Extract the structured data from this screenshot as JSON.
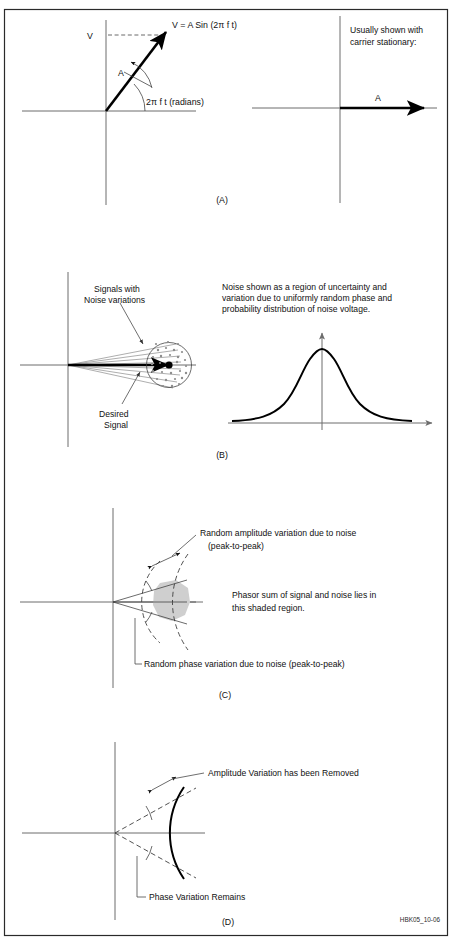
{
  "figure": {
    "code": "HBK05_10-06",
    "panels": [
      {
        "id": "A",
        "label": "(A)"
      },
      {
        "id": "B",
        "label": "(B)"
      },
      {
        "id": "C",
        "label": "(C)"
      },
      {
        "id": "D",
        "label": "(D)"
      }
    ]
  },
  "panel_a": {
    "label": "(A)",
    "equation": "V = A Sin (2π f t)",
    "v_axis_label": "V",
    "amplitude_label": "A",
    "angle_label": "2π f t (radians)",
    "right_note_line1": "Usually shown with",
    "right_note_line2": "carrier stationary:",
    "right_amplitude_label": "A"
  },
  "panel_b": {
    "label": "(B)",
    "signals_label_line1": "Signals with",
    "signals_label_line2": "Noise variations",
    "desired_label_line1": "Desired",
    "desired_label_line2": "Signal",
    "description_line1": "Noise shown as a region of uncertainty and",
    "description_line2": "variation due to uniformly random phase and",
    "description_line3": "probability distribution of noise voltage."
  },
  "panel_c": {
    "label": "(C)",
    "amplitude_note_line1": "Random amplitude variation due to noise",
    "amplitude_note_line2": "(peak-to-peak)",
    "phase_note": "Random phase variation due to noise (peak-to-peak)",
    "region_note_line1": "Phasor sum of signal and noise lies in",
    "region_note_line2": "this shaded region."
  },
  "panel_d": {
    "label": "(D)",
    "amplitude_note": "Amplitude Variation has been Removed",
    "phase_note": "Phase Variation Remains"
  },
  "colors": {
    "ink": "#111111",
    "axis": "#6d6d6d",
    "shade": "#cfcfcf",
    "frame": "#2a2a2a"
  }
}
